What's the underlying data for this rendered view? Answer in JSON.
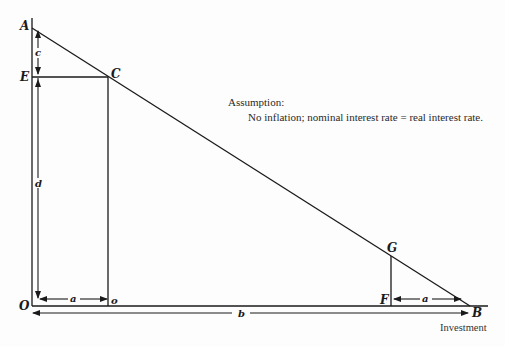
{
  "points": {
    "A": "A",
    "E": "E",
    "C": "C",
    "O": "O",
    "D": "D",
    "F": "F",
    "G": "G",
    "B": "B"
  },
  "dimensions": {
    "c": "c",
    "d": "d",
    "a_left": "a",
    "a_right": "a",
    "b": "b"
  },
  "annotation": {
    "title": "Assumption:",
    "body": "No inflation; nominal interest rate = real interest rate."
  },
  "x_axis_label": "Investment",
  "colors": {
    "ink": "#1a1a1a",
    "background": "#fdfdfd"
  }
}
